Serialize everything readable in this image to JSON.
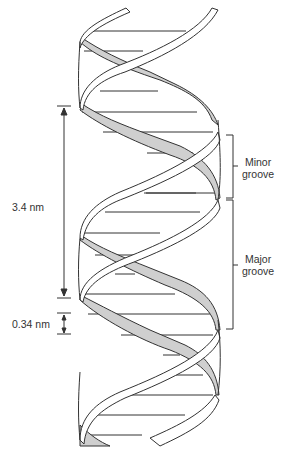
{
  "diagram": {
    "colors": {
      "background": "#ffffff",
      "stroke": "#333333",
      "shaded_strand": "#cfcfcf",
      "front_strand": "#ffffff"
    },
    "labels": {
      "pitch": "3.4 nm",
      "rise": "0.34 nm",
      "minor_groove_line1": "Minor",
      "minor_groove_line2": "groove",
      "major_groove_line1": "Major",
      "major_groove_line2": "groove"
    },
    "dimensions": {
      "pitch_nm": 3.4,
      "rise_per_base_pair_nm": 0.34
    }
  }
}
